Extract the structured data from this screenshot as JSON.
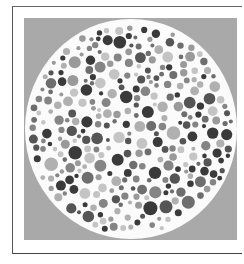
{
  "plate": {
    "type": "ishihara-color-test-plate",
    "rendering": "grayscale",
    "background_color": "#a9a9a9",
    "circle_fill": "#fbfbfb",
    "dot_colors": [
      "#3a3a3a",
      "#555555",
      "#6e6e6e",
      "#858585",
      "#9a9a9a",
      "#b0b0b0",
      "#c4c4c4"
    ]
  }
}
